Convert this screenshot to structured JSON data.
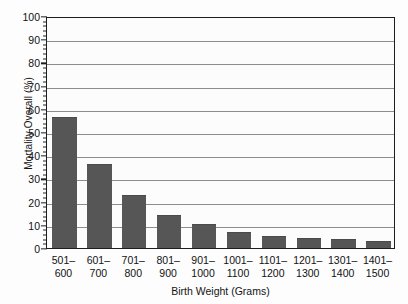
{
  "chart_data": {
    "type": "bar",
    "title": "",
    "xlabel": "Birth Weight (Grams)",
    "ylabel": "Mortality Overall (%)",
    "categories": [
      "501-600",
      "601-700",
      "701-800",
      "801-900",
      "901-1000",
      "1001-1100",
      "1101-1200",
      "1201-1300",
      "1301-1400",
      "1401-1500"
    ],
    "category_lines": [
      {
        "lo": "501–",
        "hi": "600"
      },
      {
        "lo": "601–",
        "hi": "700"
      },
      {
        "lo": "701–",
        "hi": "800"
      },
      {
        "lo": "801–",
        "hi": "900"
      },
      {
        "lo": "901–",
        "hi": "1000"
      },
      {
        "lo": "1001–",
        "hi": "1100"
      },
      {
        "lo": "1101–",
        "hi": "1200"
      },
      {
        "lo": "1201–",
        "hi": "1300"
      },
      {
        "lo": "1301–",
        "hi": "1400"
      },
      {
        "lo": "1401–",
        "hi": "1500"
      }
    ],
    "values": [
      56.3,
      36.3,
      23.0,
      14.2,
      10.2,
      7.0,
      5.3,
      4.2,
      3.9,
      3.1
    ],
    "ylim": [
      0,
      100
    ],
    "ytick_labels": [
      "0",
      "10",
      "20",
      "30",
      "40",
      "50",
      "60",
      "70",
      "80",
      "90",
      "100"
    ],
    "ytick_values": [
      0,
      10,
      20,
      30,
      40,
      50,
      60,
      70,
      80,
      90,
      100
    ],
    "yminor_step": 2,
    "grid": "horizontal",
    "legend": "none",
    "bar_color": "#565656",
    "grid_color": "#8d8d8d",
    "axis_color": "#1d1d1d",
    "background_color": "#fcfcfc"
  }
}
